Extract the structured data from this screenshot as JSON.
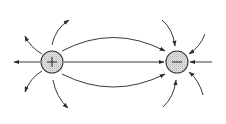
{
  "diagram": {
    "type": "electric-field-lines",
    "colors": {
      "line": "#3a3a3a",
      "charge_fill": "#d9d9d9",
      "background": "#ffffff"
    },
    "charges": [
      {
        "id": "positive",
        "sign": "+",
        "label": "+",
        "cx": 52,
        "cy": 62,
        "r": 11
      },
      {
        "id": "negative",
        "sign": "-",
        "label": "−",
        "cx": 177,
        "cy": 62,
        "r": 11
      }
    ],
    "field_lines": [
      {
        "id": "left-horizontal-out",
        "from": "positive",
        "direction": "outward",
        "to_edge": "left"
      },
      {
        "id": "upper-left-out-1",
        "from": "positive",
        "direction": "outward"
      },
      {
        "id": "upper-left-out-2",
        "from": "positive",
        "direction": "outward"
      },
      {
        "id": "lower-left-out-1",
        "from": "positive",
        "direction": "outward"
      },
      {
        "id": "lower-left-out-2",
        "from": "positive",
        "direction": "outward"
      },
      {
        "id": "center-straight",
        "from": "positive",
        "to": "negative"
      },
      {
        "id": "center-upper-arc",
        "from": "positive",
        "to": "negative"
      },
      {
        "id": "center-lower-arc",
        "from": "positive",
        "to": "negative"
      },
      {
        "id": "right-horizontal-in",
        "to": "negative",
        "direction": "inward",
        "from_edge": "right"
      },
      {
        "id": "upper-in-1",
        "to": "negative",
        "direction": "inward"
      },
      {
        "id": "upper-in-2",
        "to": "negative",
        "direction": "inward"
      },
      {
        "id": "lower-in-1",
        "to": "negative",
        "direction": "inward"
      },
      {
        "id": "lower-in-2",
        "to": "negative",
        "direction": "inward"
      }
    ]
  },
  "labels": {
    "positive_charge": "+",
    "negative_charge": "−"
  }
}
